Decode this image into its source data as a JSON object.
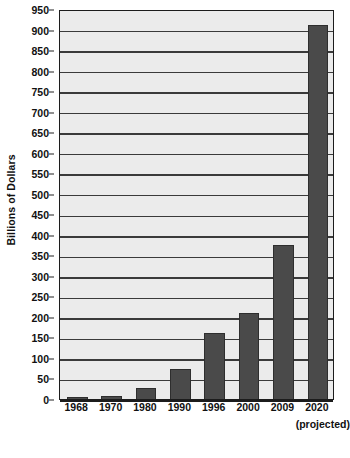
{
  "chart_data": {
    "type": "bar",
    "title": "",
    "xlabel": "",
    "ylabel": "Billions of Dollars",
    "categories": [
      "1968",
      "1970",
      "1980",
      "1990",
      "1996",
      "2000",
      "2009",
      "2020"
    ],
    "category_note": "(projected)",
    "category_note_applies_to": "2020",
    "values": [
      3,
      8,
      28,
      72,
      160,
      210,
      375,
      910
    ],
    "ylim": [
      0,
      950
    ],
    "ytick_step": 50,
    "yticks": [
      0,
      50,
      100,
      150,
      200,
      250,
      300,
      350,
      400,
      450,
      500,
      550,
      600,
      650,
      700,
      750,
      800,
      850,
      900,
      950
    ],
    "ytick_labels": [
      "0",
      "50",
      "100",
      "150",
      "200",
      "250",
      "300",
      "350",
      "400",
      "450",
      "500",
      "550",
      "600",
      "650",
      "700",
      "750",
      "800",
      "850",
      "900",
      "950"
    ],
    "grid": true,
    "grid_axis": "y",
    "legend": false,
    "legend_position": "none",
    "colors": {
      "bar_fill": "#4a4a4a",
      "bar_edge": "#2e2e2e",
      "plot_background": "#ebebeb",
      "gridline": "#3a3a3a",
      "axis": "#1c1c1c",
      "text": "#111111",
      "page_background": "#ffffff"
    }
  }
}
